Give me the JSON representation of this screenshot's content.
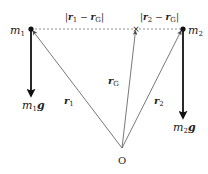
{
  "diagram": {
    "points": {
      "m1": {
        "label": "m",
        "sub": "1",
        "x": 31,
        "y": 29
      },
      "m2": {
        "label": "m",
        "sub": "2",
        "x": 183,
        "y": 29
      },
      "G": {
        "marker": "×",
        "x": 136,
        "y": 29
      },
      "O": {
        "label": "O",
        "x": 122,
        "y": 148
      }
    },
    "vectors": {
      "r1": {
        "label": "r",
        "sub": "1"
      },
      "r2": {
        "label": "r",
        "sub": "2"
      },
      "rG": {
        "label": "r",
        "sub": "G"
      }
    },
    "forces": {
      "m1g": {
        "m": "m",
        "sub": "1",
        "g": "g"
      },
      "m2g": {
        "m": "m",
        "sub": "2",
        "g": "g"
      }
    },
    "distances": {
      "d1": {
        "text_open": "|",
        "a": "r",
        "a_sub": "1",
        "op": " − ",
        "b": "r",
        "b_sub": "G",
        "text_close": "|"
      },
      "d2": {
        "text_open": "|",
        "a": "r",
        "a_sub": "2",
        "op": " − ",
        "b": "r",
        "b_sub": "G",
        "text_close": "|"
      }
    },
    "colors": {
      "line": "#333333",
      "thin": "#555555",
      "dashed": "#777777",
      "text": "#222222"
    }
  }
}
